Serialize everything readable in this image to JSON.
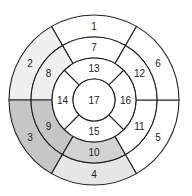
{
  "diagram": {
    "type": "bullseye-17-segment",
    "caption": "",
    "center": [
      94,
      100
    ],
    "radii": [
      85,
      63,
      42,
      21
    ],
    "colors": {
      "white": "#ffffff",
      "light": "#efefef",
      "light2": "#e6e6e6",
      "medium": "#d2d2d2",
      "dark": "#c6c6c6",
      "stroke": "#222222"
    },
    "segments": [
      {
        "id": "1",
        "label": "1",
        "ring": 0,
        "start": 240,
        "end": 300,
        "fill": "#ffffff"
      },
      {
        "id": "2",
        "label": "2",
        "ring": 0,
        "start": 180,
        "end": 240,
        "fill": "#efefef"
      },
      {
        "id": "3",
        "label": "3",
        "ring": 0,
        "start": 120,
        "end": 180,
        "fill": "#c6c6c6"
      },
      {
        "id": "4",
        "label": "4",
        "ring": 0,
        "start": 60,
        "end": 120,
        "fill": "#e6e6e6"
      },
      {
        "id": "5",
        "label": "5",
        "ring": 0,
        "start": 0,
        "end": 60,
        "fill": "#ffffff"
      },
      {
        "id": "6",
        "label": "6",
        "ring": 0,
        "start": 300,
        "end": 360,
        "fill": "#ffffff"
      },
      {
        "id": "7",
        "label": "7",
        "ring": 1,
        "start": 240,
        "end": 300,
        "fill": "#ffffff"
      },
      {
        "id": "8",
        "label": "8",
        "ring": 1,
        "start": 180,
        "end": 240,
        "fill": "#efefef"
      },
      {
        "id": "9",
        "label": "9",
        "ring": 1,
        "start": 120,
        "end": 180,
        "fill": "#c6c6c6"
      },
      {
        "id": "10",
        "label": "10",
        "ring": 1,
        "start": 60,
        "end": 120,
        "fill": "#d2d2d2"
      },
      {
        "id": "11",
        "label": "11",
        "ring": 1,
        "start": 0,
        "end": 60,
        "fill": "#ffffff"
      },
      {
        "id": "12",
        "label": "12",
        "ring": 1,
        "start": 300,
        "end": 360,
        "fill": "#ffffff"
      },
      {
        "id": "13",
        "label": "13",
        "ring": 2,
        "start": 225,
        "end": 315,
        "fill": "#ffffff"
      },
      {
        "id": "14",
        "label": "14",
        "ring": 2,
        "start": 135,
        "end": 225,
        "fill": "#ffffff"
      },
      {
        "id": "15",
        "label": "15",
        "ring": 2,
        "start": 45,
        "end": 135,
        "fill": "#ffffff"
      },
      {
        "id": "16",
        "label": "16",
        "ring": 2,
        "start": -45,
        "end": 45,
        "fill": "#ffffff"
      },
      {
        "id": "17",
        "label": "17",
        "ring": 3,
        "start": 0,
        "end": 360,
        "fill": "#ffffff"
      }
    ]
  }
}
